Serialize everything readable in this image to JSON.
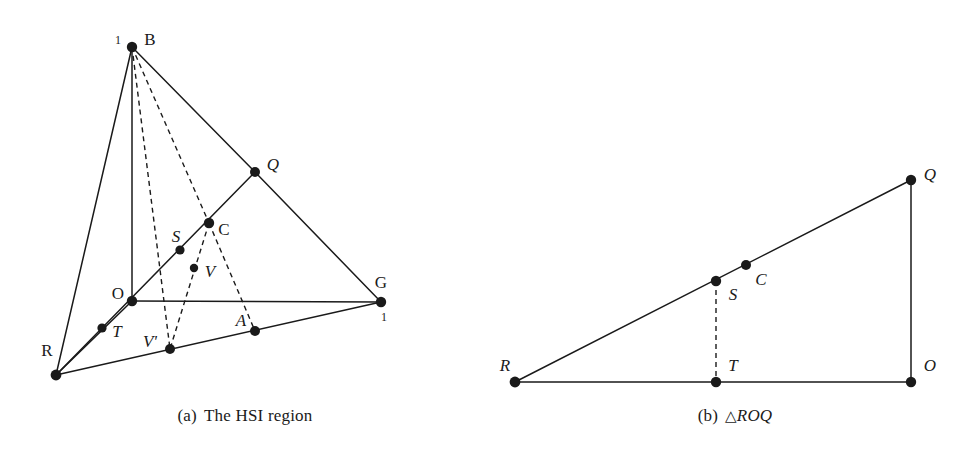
{
  "figure": {
    "background": "#ffffff",
    "ink": "#1a1a1a",
    "panels": [
      {
        "id": "panel-a",
        "caption_label": "(a)",
        "caption_text": "The HSI region",
        "vertices": [
          {
            "name": "B",
            "label": "B",
            "x": 132,
            "y": 47,
            "lx": 150,
            "ly": 41,
            "r": 5.2,
            "style": "upright"
          },
          {
            "name": "Q",
            "label": "Q",
            "x": 255,
            "y": 172,
            "lx": 273,
            "ly": 166,
            "r": 5.0,
            "style": "italic"
          },
          {
            "name": "C",
            "label": "C",
            "x": 209,
            "y": 223,
            "lx": 224,
            "ly": 231,
            "r": 5.2,
            "style": "upright"
          },
          {
            "name": "S",
            "label": "S",
            "x": 180,
            "y": 250,
            "lx": 176,
            "ly": 238,
            "r": 4.6,
            "style": "italic"
          },
          {
            "name": "V",
            "label": "V",
            "x": 194,
            "y": 268,
            "lx": 210,
            "ly": 273,
            "r": 4.2,
            "style": "italic"
          },
          {
            "name": "O",
            "label": "O",
            "x": 132,
            "y": 301,
            "lx": 118,
            "ly": 295,
            "r": 5.2,
            "style": "upright"
          },
          {
            "name": "G",
            "label": "G",
            "x": 381,
            "y": 302,
            "lx": 381,
            "ly": 284,
            "r": 5.2,
            "style": "upright"
          },
          {
            "name": "T",
            "label": "T",
            "x": 102,
            "y": 328,
            "lx": 117,
            "ly": 333,
            "r": 4.6,
            "style": "italic"
          },
          {
            "name": "A",
            "label": "A",
            "x": 255,
            "y": 331,
            "lx": 241,
            "ly": 322,
            "r": 5.0,
            "style": "italic"
          },
          {
            "name": "Vp",
            "label": "V'",
            "x": 170,
            "y": 349,
            "lx": 150,
            "ly": 343,
            "r": 5.0,
            "style": "italic"
          },
          {
            "name": "R",
            "label": "R",
            "x": 56,
            "y": 375,
            "lx": 47,
            "ly": 352,
            "r": 5.4,
            "style": "upright"
          }
        ],
        "axis_ticks": [
          {
            "name": "tick-b-one",
            "text": "1",
            "x": 118,
            "y": 41
          },
          {
            "name": "tick-g-one",
            "text": "1",
            "x": 384,
            "y": 318
          }
        ],
        "solid_edges": [
          {
            "name": "edge-B-O",
            "x1": 132,
            "y1": 47,
            "x2": 132,
            "y2": 301
          },
          {
            "name": "edge-B-R",
            "x1": 132,
            "y1": 47,
            "x2": 56,
            "y2": 375
          },
          {
            "name": "edge-B-Q",
            "x1": 132,
            "y1": 47,
            "x2": 255,
            "y2": 172
          },
          {
            "name": "edge-Q-G",
            "x1": 255,
            "y1": 172,
            "x2": 381,
            "y2": 302
          },
          {
            "name": "edge-R-Q",
            "x1": 56,
            "y1": 375,
            "x2": 255,
            "y2": 172
          },
          {
            "name": "edge-O-G",
            "x1": 132,
            "y1": 301,
            "x2": 381,
            "y2": 302
          },
          {
            "name": "edge-R-O",
            "x1": 56,
            "y1": 375,
            "x2": 132,
            "y2": 301
          },
          {
            "name": "edge-R-G",
            "x1": 56,
            "y1": 375,
            "x2": 381,
            "y2": 302
          }
        ],
        "dashed_edges": [
          {
            "name": "edge-B-C",
            "x1": 132,
            "y1": 47,
            "x2": 209,
            "y2": 223
          },
          {
            "name": "edge-B-Vp",
            "x1": 132,
            "y1": 47,
            "x2": 170,
            "y2": 349
          },
          {
            "name": "edge-C-Vp",
            "x1": 209,
            "y1": 223,
            "x2": 170,
            "y2": 349
          },
          {
            "name": "edge-C-A",
            "x1": 209,
            "y1": 223,
            "x2": 255,
            "y2": 331
          }
        ]
      },
      {
        "id": "panel-b",
        "caption_label": "(b)",
        "caption_text": "ROQ",
        "caption_symbol": "△",
        "vertices": [
          {
            "name": "Q",
            "label": "Q",
            "x": 911,
            "y": 180,
            "lx": 930,
            "ly": 176,
            "r": 5.2,
            "style": "italic"
          },
          {
            "name": "C",
            "label": "C",
            "x": 746,
            "y": 265,
            "lx": 761,
            "ly": 281,
            "r": 5.0,
            "style": "italic"
          },
          {
            "name": "S",
            "label": "S",
            "x": 716,
            "y": 281,
            "lx": 733,
            "ly": 296,
            "r": 5.2,
            "style": "italic"
          },
          {
            "name": "O",
            "label": "O",
            "x": 911,
            "y": 382,
            "lx": 930,
            "ly": 367,
            "r": 5.2,
            "style": "italic"
          },
          {
            "name": "T",
            "label": "T",
            "x": 716,
            "y": 382,
            "lx": 733,
            "ly": 367,
            "r": 5.2,
            "style": "italic"
          },
          {
            "name": "R",
            "label": "R",
            "x": 515,
            "y": 382,
            "lx": 505,
            "ly": 367,
            "r": 5.4,
            "style": "italic"
          }
        ],
        "solid_edges": [
          {
            "name": "edge-R-Q",
            "x1": 515,
            "y1": 382,
            "x2": 911,
            "y2": 180
          },
          {
            "name": "edge-Q-O",
            "x1": 911,
            "y1": 180,
            "x2": 911,
            "y2": 382
          },
          {
            "name": "edge-R-O",
            "x1": 515,
            "y1": 382,
            "x2": 911,
            "y2": 382
          }
        ],
        "dashed_edges": [
          {
            "name": "edge-S-T",
            "x1": 716,
            "y1": 281,
            "x2": 716,
            "y2": 382
          }
        ]
      }
    ]
  }
}
